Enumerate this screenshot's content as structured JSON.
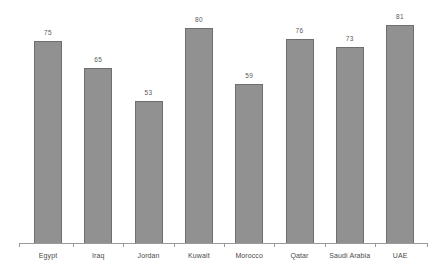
{
  "chart_data": {
    "type": "bar",
    "title": "",
    "subtitle": "",
    "xlabel": "",
    "ylabel": "",
    "categories": [
      "Egypt",
      "Iraq",
      "Jordan",
      "Kuwait",
      "Morocco",
      "Qatar",
      "Saudi Arabia",
      "UAE"
    ],
    "values": [
      75,
      65,
      53,
      80,
      59,
      76,
      73,
      81
    ],
    "value_labels": [
      "75",
      "65",
      "53",
      "80",
      "59",
      "76",
      "73",
      "81"
    ],
    "ylim": [
      0,
      84
    ],
    "grid": false,
    "legend": null,
    "legend_position": "none",
    "annotations": [],
    "bar_color": "#919191",
    "bar_border_color": "#6e6e6e",
    "axis_color": "#9a9a9a",
    "label_color": "#4a4a4a",
    "value_color": "#5a5a5a",
    "background": "#ffffff"
  }
}
